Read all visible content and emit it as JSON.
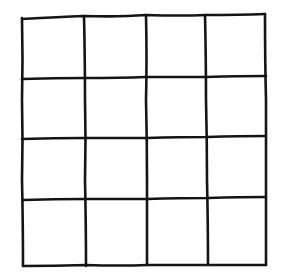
{
  "diagram": {
    "type": "grid",
    "rows": 4,
    "columns": 4,
    "style": "hand-drawn",
    "line_color": "#141414",
    "background": "#ffffff",
    "cells": [
      [
        "",
        "",
        "",
        ""
      ],
      [
        "",
        "",
        "",
        ""
      ],
      [
        "",
        "",
        "",
        ""
      ],
      [
        "",
        "",
        "",
        ""
      ]
    ]
  }
}
